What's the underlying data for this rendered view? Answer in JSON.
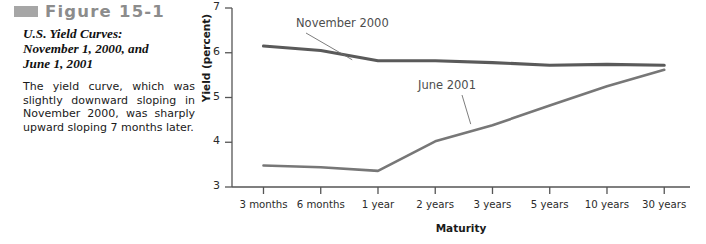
{
  "figure": {
    "bullet_icon": "figure-bullet-square",
    "number_label": "Figure 15-1",
    "title_line1": "U.S. Yield Curves:",
    "title_line2": "November 1, 2000, and",
    "title_line3": "June 1, 2001",
    "description": "The yield curve, which was slightly downward sloping in November 2000, was sharply upward sloping 7 months later."
  },
  "colors": {
    "bullet": "#a6a6a6",
    "figure_number": "#8c8c8c",
    "series_november": "#5a5a5a",
    "series_june": "#777777",
    "axis": "#555555"
  },
  "chart_data": {
    "type": "line",
    "title": "U.S. Yield Curves: November 1, 2000, and June 1, 2001",
    "xlabel": "Maturity",
    "ylabel": "Yield (percent)",
    "categories": [
      "3 months",
      "6 months",
      "1 year",
      "2 years",
      "3 years",
      "5 years",
      "10 years",
      "30 years"
    ],
    "ylim": [
      3,
      7
    ],
    "yticks": [
      3,
      4,
      5,
      6,
      7
    ],
    "grid": false,
    "legend": "inline-annotations",
    "series": [
      {
        "name": "November 2000",
        "values": [
          6.15,
          6.05,
          5.82,
          5.82,
          5.78,
          5.72,
          5.74,
          5.72
        ]
      },
      {
        "name": "June 2001",
        "values": [
          3.48,
          3.44,
          3.36,
          4.02,
          4.38,
          4.82,
          5.25,
          5.62
        ]
      }
    ],
    "annotations": [
      {
        "text": "November 2000",
        "series": "November 2000"
      },
      {
        "text": "June 2001",
        "series": "June 2001"
      }
    ]
  }
}
